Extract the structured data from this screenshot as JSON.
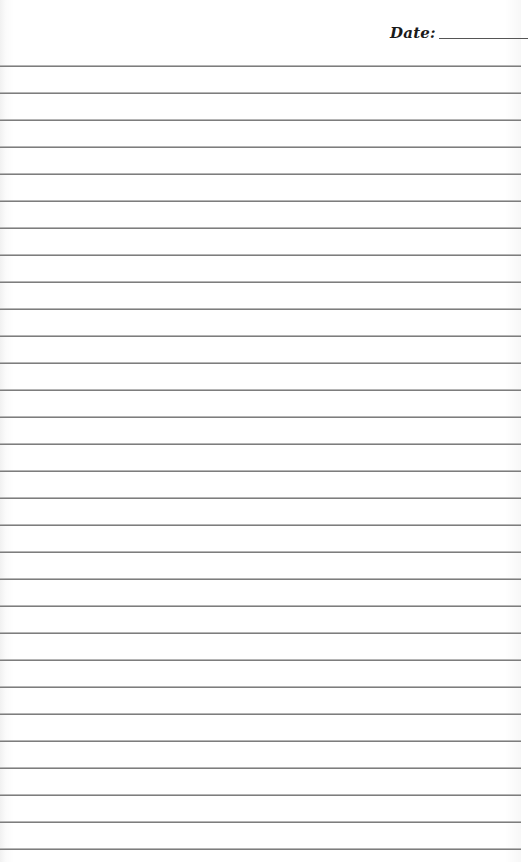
{
  "header": {
    "date_label": "Date:",
    "date_value": ""
  },
  "page": {
    "type": "lined-notepaper",
    "line_count": 30,
    "first_line_y": 65,
    "line_spacing": 27,
    "line_color": "#7d7d7d",
    "background_color": "#ffffff"
  }
}
